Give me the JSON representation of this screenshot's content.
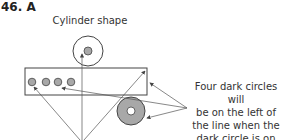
{
  "question": {
    "number_label": "46. A"
  },
  "diagram": {
    "top_label": "Cylinder shape",
    "note_lines": [
      "Four dark circles will",
      "be on the left of",
      "the line when the",
      "dark circle is on top."
    ],
    "colors": {
      "stroke": "#444444",
      "dark_fill": "#a8a8a8",
      "background": "#ffffff"
    },
    "small_circles_count": 4
  }
}
